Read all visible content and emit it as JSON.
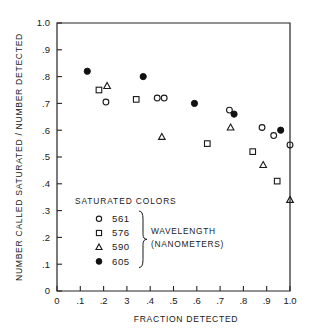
{
  "chart_data": {
    "type": "scatter",
    "title": "",
    "xlabel": "FRACTION DETECTED",
    "ylabel": "NUMBER CALLED SATURATED / NUMBER DETECTED",
    "xlim": [
      0,
      1.0
    ],
    "ylim": [
      0,
      1.0
    ],
    "grid": false,
    "legend_position": "inside-lower-left",
    "xticks": [
      "0",
      ".1",
      ".2",
      "3",
      ".4",
      ".5",
      ".6",
      ".7",
      ".8",
      ".9",
      "1.0"
    ],
    "xtick_values": [
      0,
      0.1,
      0.2,
      0.3,
      0.4,
      0.5,
      0.6,
      0.7,
      0.8,
      0.9,
      1.0
    ],
    "yticks": [
      "0",
      ".1",
      ".2",
      ".3",
      ".4",
      ".5",
      ".6",
      ".7",
      ".8",
      ".9",
      "1.0"
    ],
    "ytick_values": [
      0,
      0.1,
      0.2,
      0.3,
      0.4,
      0.5,
      0.6,
      0.7,
      0.8,
      0.9,
      1.0
    ],
    "legend_heading": "SATURATED COLORS",
    "legend_note_line1": "WAVELENGTH",
    "legend_note_line2": "(NANOMETERS)",
    "series": [
      {
        "name": "561",
        "marker": "open-circle",
        "points": [
          {
            "x": 0.21,
            "y": 0.705
          },
          {
            "x": 0.43,
            "y": 0.72
          },
          {
            "x": 0.46,
            "y": 0.72
          },
          {
            "x": 0.74,
            "y": 0.675
          },
          {
            "x": 0.88,
            "y": 0.61
          },
          {
            "x": 0.93,
            "y": 0.58
          },
          {
            "x": 1.0,
            "y": 0.545
          }
        ]
      },
      {
        "name": "576",
        "marker": "open-square",
        "points": [
          {
            "x": 0.18,
            "y": 0.75
          },
          {
            "x": 0.34,
            "y": 0.715
          },
          {
            "x": 0.645,
            "y": 0.55
          },
          {
            "x": 0.84,
            "y": 0.52
          },
          {
            "x": 0.945,
            "y": 0.41
          }
        ]
      },
      {
        "name": "590",
        "marker": "open-triangle",
        "points": [
          {
            "x": 0.215,
            "y": 0.765
          },
          {
            "x": 0.45,
            "y": 0.575
          },
          {
            "x": 0.745,
            "y": 0.61
          },
          {
            "x": 0.885,
            "y": 0.47
          },
          {
            "x": 1.0,
            "y": 0.34
          }
        ]
      },
      {
        "name": "605",
        "marker": "filled-circle",
        "points": [
          {
            "x": 0.13,
            "y": 0.82
          },
          {
            "x": 0.37,
            "y": 0.8
          },
          {
            "x": 0.59,
            "y": 0.7
          },
          {
            "x": 0.76,
            "y": 0.66
          },
          {
            "x": 0.96,
            "y": 0.6
          }
        ]
      }
    ]
  }
}
